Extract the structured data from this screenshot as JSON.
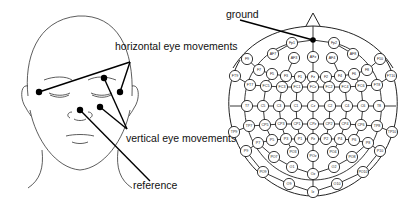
{
  "face_diagram": {
    "labels": {
      "horizontal": "horizontal eye movements",
      "vertical": "vertical eye movements",
      "reference": "reference"
    },
    "electrodes": [
      {
        "name": "left-outer-canthus",
        "x": 39,
        "y": 92
      },
      {
        "name": "right-outer-canthus",
        "x": 120,
        "y": 92
      },
      {
        "name": "above-right-eye",
        "x": 104,
        "y": 78
      },
      {
        "name": "below-right-eye",
        "x": 100,
        "y": 107
      },
      {
        "name": "nose-reference",
        "x": 80,
        "y": 110
      }
    ]
  },
  "cap_diagram": {
    "labels": {
      "ground": "ground"
    },
    "electrodes": [
      {
        "id": "Fp1",
        "x": 292,
        "y": 43
      },
      {
        "id": "Fp2",
        "x": 334,
        "y": 43
      },
      {
        "id": "AF7",
        "x": 273,
        "y": 54
      },
      {
        "id": "AF3",
        "x": 294,
        "y": 58
      },
      {
        "id": "AFz",
        "x": 313,
        "y": 57
      },
      {
        "id": "AF4",
        "x": 332,
        "y": 58
      },
      {
        "id": "AF8",
        "x": 353,
        "y": 54
      },
      {
        "id": "F9",
        "x": 247,
        "y": 59
      },
      {
        "id": "F10",
        "x": 380,
        "y": 59
      },
      {
        "id": "F7",
        "x": 259,
        "y": 70
      },
      {
        "id": "F5",
        "x": 272,
        "y": 74
      },
      {
        "id": "F3",
        "x": 286,
        "y": 76
      },
      {
        "id": "F1",
        "x": 300,
        "y": 77
      },
      {
        "id": "Fz",
        "x": 313,
        "y": 77
      },
      {
        "id": "F2",
        "x": 326,
        "y": 77
      },
      {
        "id": "F4",
        "x": 340,
        "y": 76
      },
      {
        "id": "F6",
        "x": 354,
        "y": 74
      },
      {
        "id": "F8",
        "x": 367,
        "y": 70
      },
      {
        "id": "FT9",
        "x": 235,
        "y": 76
      },
      {
        "id": "FT10",
        "x": 391,
        "y": 76
      },
      {
        "id": "FT7",
        "x": 250,
        "y": 85
      },
      {
        "id": "FC5",
        "x": 266,
        "y": 86
      },
      {
        "id": "FC3",
        "x": 282,
        "y": 87
      },
      {
        "id": "FC1",
        "x": 297,
        "y": 87
      },
      {
        "id": "FCz",
        "x": 313,
        "y": 87
      },
      {
        "id": "FC2",
        "x": 329,
        "y": 87
      },
      {
        "id": "FC4",
        "x": 345,
        "y": 87
      },
      {
        "id": "FC6",
        "x": 361,
        "y": 86
      },
      {
        "id": "FT8",
        "x": 377,
        "y": 85
      },
      {
        "id": "T7",
        "x": 247,
        "y": 106
      },
      {
        "id": "C5",
        "x": 263,
        "y": 106
      },
      {
        "id": "C3",
        "x": 279,
        "y": 106
      },
      {
        "id": "C1",
        "x": 296,
        "y": 106
      },
      {
        "id": "Cz",
        "x": 313,
        "y": 106
      },
      {
        "id": "C2",
        "x": 330,
        "y": 106
      },
      {
        "id": "C4",
        "x": 347,
        "y": 106
      },
      {
        "id": "C6",
        "x": 363,
        "y": 106
      },
      {
        "id": "T8",
        "x": 379,
        "y": 106
      },
      {
        "id": "TP9",
        "x": 234,
        "y": 132
      },
      {
        "id": "TP10",
        "x": 392,
        "y": 132
      },
      {
        "id": "TP7",
        "x": 249,
        "y": 126
      },
      {
        "id": "CP5",
        "x": 265,
        "y": 125
      },
      {
        "id": "CP3",
        "x": 281,
        "y": 124
      },
      {
        "id": "CP1",
        "x": 297,
        "y": 124
      },
      {
        "id": "CPz",
        "x": 313,
        "y": 124
      },
      {
        "id": "CP2",
        "x": 329,
        "y": 124
      },
      {
        "id": "CP4",
        "x": 345,
        "y": 124
      },
      {
        "id": "CP6",
        "x": 361,
        "y": 125
      },
      {
        "id": "TP8",
        "x": 377,
        "y": 126
      },
      {
        "id": "P9",
        "x": 246,
        "y": 151
      },
      {
        "id": "P10",
        "x": 380,
        "y": 151
      },
      {
        "id": "P7",
        "x": 258,
        "y": 143
      },
      {
        "id": "P5",
        "x": 272,
        "y": 140
      },
      {
        "id": "P3",
        "x": 286,
        "y": 139
      },
      {
        "id": "P1",
        "x": 300,
        "y": 139
      },
      {
        "id": "Pz",
        "x": 313,
        "y": 139
      },
      {
        "id": "P2",
        "x": 326,
        "y": 139
      },
      {
        "id": "P4",
        "x": 340,
        "y": 139
      },
      {
        "id": "P6",
        "x": 354,
        "y": 140
      },
      {
        "id": "P8",
        "x": 368,
        "y": 143
      },
      {
        "id": "PO7",
        "x": 274,
        "y": 157
      },
      {
        "id": "PO3",
        "x": 293,
        "y": 152
      },
      {
        "id": "POz",
        "x": 313,
        "y": 156
      },
      {
        "id": "PO4",
        "x": 333,
        "y": 152
      },
      {
        "id": "PO8",
        "x": 352,
        "y": 157
      },
      {
        "id": "PO9",
        "x": 263,
        "y": 172
      },
      {
        "id": "O1",
        "x": 292,
        "y": 167
      },
      {
        "id": "Oz",
        "x": 313,
        "y": 174
      },
      {
        "id": "O2",
        "x": 334,
        "y": 167
      },
      {
        "id": "PO10",
        "x": 363,
        "y": 172
      },
      {
        "id": "O9",
        "x": 289,
        "y": 184
      },
      {
        "id": "Iz",
        "x": 313,
        "y": 192
      },
      {
        "id": "O10",
        "x": 337,
        "y": 184
      }
    ]
  }
}
